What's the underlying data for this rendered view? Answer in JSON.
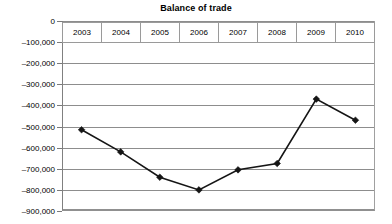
{
  "chart_data": {
    "type": "line",
    "title": "Balance of trade",
    "xlabel": "",
    "ylabel": "",
    "categories": [
      "2003",
      "2004",
      "2005",
      "2006",
      "2007",
      "2008",
      "2009",
      "2010"
    ],
    "values": [
      -515000,
      -620000,
      -740000,
      -800000,
      -705000,
      -675000,
      -370000,
      -470000
    ],
    "series": [
      {
        "name": "Balance of trade",
        "values": [
          -515000,
          -620000,
          -740000,
          -800000,
          -705000,
          -675000,
          -370000,
          -470000
        ]
      }
    ],
    "ylim": [
      -900000,
      0
    ],
    "ytick_values": [
      0,
      -100000,
      -200000,
      -300000,
      -400000,
      -500000,
      -600000,
      -700000,
      -800000,
      -900000
    ],
    "ytick_labels": [
      "0",
      "–100,000",
      "–200,000",
      "–300,000",
      "–400,000",
      "–500,000",
      "–600,000",
      "–700,000",
      "–800,000",
      "–900,000"
    ],
    "grid": true,
    "legend": "none",
    "marker": "diamond",
    "line_color": "#151515",
    "grid_color": "#8d8d8d"
  }
}
